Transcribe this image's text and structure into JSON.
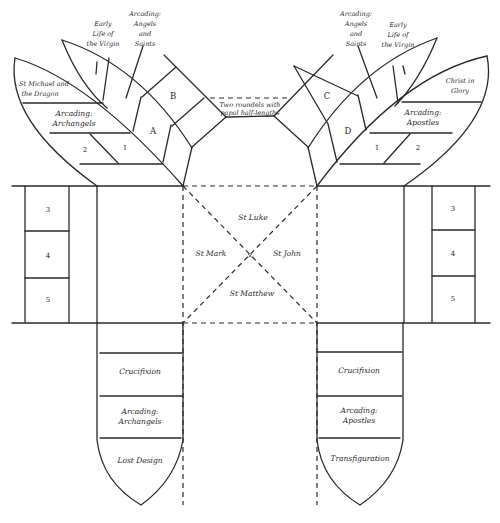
{
  "diagram": {
    "left_upper": {
      "outer_wing": {
        "top": "St Michael and|the Dragon",
        "middle": "Arcading:|Archangels",
        "panel_1": "1",
        "panel_2": "2"
      },
      "inner_wing": {
        "early_life": "Early|Life of|the Virgin",
        "arcading": "Arcading:|Angels|and|Saints"
      },
      "box_a": "A",
      "box_b": "B"
    },
    "right_upper": {
      "outer_wing": {
        "top": "Christ in|Glory",
        "middle": "Arcading:|Apostles",
        "panel_1": "1",
        "panel_2": "2"
      },
      "inner_wing": {
        "arcading": "Arcading:|Angels|and|Saints",
        "early_life": "Early|Life of|the Virgin"
      },
      "box_c": "C",
      "box_d": "D"
    },
    "roundels": "Two roundels with|papal half-lengths",
    "left_side_panels": [
      "3",
      "4",
      "5"
    ],
    "right_side_panels": [
      "3",
      "4",
      "5"
    ],
    "center": {
      "top": "St Luke",
      "left": "St Mark",
      "right": "St John",
      "bottom": "St Matthew",
      "center_mark": "×"
    },
    "left_lower": {
      "crucifixion": "Crucifixion",
      "arcading": "Arcading:|Archangels",
      "bottom": "Lost Design"
    },
    "right_lower": {
      "crucifixion": "Crucifixion",
      "arcading": "Arcading:|Apostles",
      "bottom": "Transfiguration"
    }
  }
}
